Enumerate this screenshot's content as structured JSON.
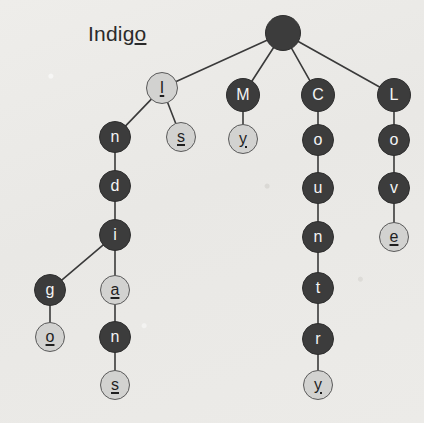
{
  "title": {
    "prefix": "Indig",
    "underlined_suffix": "o",
    "full_text": "Indigo",
    "x": 88,
    "y": 22
  },
  "canvas": {
    "width": 424,
    "height": 423
  },
  "colors": {
    "background": "#ecebe8",
    "node_dark_fill": "#3c3c3c",
    "node_dark_text": "#f4f4f4",
    "node_light_fill": "#d2d2d0",
    "node_light_text": "#1f1f1f",
    "node_light_border": "#5a5a5a",
    "edge": "#3a3a3a"
  },
  "legend": {
    "dark_meaning": "intermediate node",
    "light_meaning": "word-end node (underlined letter)"
  },
  "graph": {
    "type": "trie",
    "words": [
      "I",
      "Is",
      "Indigo",
      "India",
      "Indians",
      "My",
      "Country",
      "Love"
    ],
    "nodes": [
      {
        "id": "root",
        "label": "",
        "style": "dark",
        "terminal": false,
        "x": 283,
        "y": 33,
        "r": 18
      },
      {
        "id": "I",
        "label": "I",
        "style": "light",
        "terminal": true,
        "x": 162,
        "y": 88,
        "r": 16
      },
      {
        "id": "Is",
        "label": "s",
        "style": "light",
        "terminal": true,
        "x": 181,
        "y": 137,
        "r": 15
      },
      {
        "id": "In",
        "label": "n",
        "style": "dark",
        "terminal": false,
        "x": 115,
        "y": 137,
        "r": 16
      },
      {
        "id": "Ind",
        "label": "d",
        "style": "dark",
        "terminal": false,
        "x": 115,
        "y": 186,
        "r": 16
      },
      {
        "id": "Indi",
        "label": "i",
        "style": "dark",
        "terminal": false,
        "x": 115,
        "y": 235,
        "r": 16
      },
      {
        "id": "Indig",
        "label": "g",
        "style": "dark",
        "terminal": false,
        "x": 50,
        "y": 290,
        "r": 16
      },
      {
        "id": "Indigo",
        "label": "o",
        "style": "light",
        "terminal": true,
        "x": 50,
        "y": 337,
        "r": 15
      },
      {
        "id": "India",
        "label": "a",
        "style": "light",
        "terminal": true,
        "x": 115,
        "y": 290,
        "r": 15
      },
      {
        "id": "Indian",
        "label": "n",
        "style": "dark",
        "terminal": false,
        "x": 115,
        "y": 337,
        "r": 16
      },
      {
        "id": "Indians",
        "label": "s",
        "style": "light",
        "terminal": true,
        "x": 115,
        "y": 385,
        "r": 15
      },
      {
        "id": "M",
        "label": "M",
        "style": "dark",
        "terminal": false,
        "x": 243,
        "y": 95,
        "r": 17
      },
      {
        "id": "My",
        "label": "y",
        "style": "light",
        "terminal": true,
        "x": 243,
        "y": 139,
        "r": 15
      },
      {
        "id": "C",
        "label": "C",
        "style": "dark",
        "terminal": false,
        "x": 318,
        "y": 95,
        "r": 17
      },
      {
        "id": "Co",
        "label": "o",
        "style": "dark",
        "terminal": false,
        "x": 318,
        "y": 140,
        "r": 16
      },
      {
        "id": "Cou",
        "label": "u",
        "style": "dark",
        "terminal": false,
        "x": 318,
        "y": 188,
        "r": 16
      },
      {
        "id": "Coun",
        "label": "n",
        "style": "dark",
        "terminal": false,
        "x": 318,
        "y": 237,
        "r": 16
      },
      {
        "id": "Count",
        "label": "t",
        "style": "dark",
        "terminal": false,
        "x": 318,
        "y": 288,
        "r": 16
      },
      {
        "id": "Countr",
        "label": "r",
        "style": "dark",
        "terminal": false,
        "x": 318,
        "y": 339,
        "r": 16
      },
      {
        "id": "Country",
        "label": "y",
        "style": "light",
        "terminal": true,
        "x": 318,
        "y": 385,
        "r": 15
      },
      {
        "id": "L",
        "label": "L",
        "style": "dark",
        "terminal": false,
        "x": 394,
        "y": 95,
        "r": 17
      },
      {
        "id": "Lo",
        "label": "o",
        "style": "dark",
        "terminal": false,
        "x": 394,
        "y": 140,
        "r": 16
      },
      {
        "id": "Lov",
        "label": "v",
        "style": "dark",
        "terminal": false,
        "x": 394,
        "y": 188,
        "r": 16
      },
      {
        "id": "Love",
        "label": "e",
        "style": "light",
        "terminal": true,
        "x": 394,
        "y": 237,
        "r": 15
      }
    ],
    "edges": [
      {
        "from": "root",
        "to": "I"
      },
      {
        "from": "root",
        "to": "M"
      },
      {
        "from": "root",
        "to": "C"
      },
      {
        "from": "root",
        "to": "L"
      },
      {
        "from": "I",
        "to": "In"
      },
      {
        "from": "I",
        "to": "Is"
      },
      {
        "from": "In",
        "to": "Ind"
      },
      {
        "from": "Ind",
        "to": "Indi"
      },
      {
        "from": "Indi",
        "to": "Indig"
      },
      {
        "from": "Indi",
        "to": "India"
      },
      {
        "from": "Indig",
        "to": "Indigo"
      },
      {
        "from": "India",
        "to": "Indian"
      },
      {
        "from": "Indian",
        "to": "Indians"
      },
      {
        "from": "M",
        "to": "My"
      },
      {
        "from": "C",
        "to": "Co"
      },
      {
        "from": "Co",
        "to": "Cou"
      },
      {
        "from": "Cou",
        "to": "Coun"
      },
      {
        "from": "Coun",
        "to": "Count"
      },
      {
        "from": "Count",
        "to": "Countr"
      },
      {
        "from": "Countr",
        "to": "Country"
      },
      {
        "from": "L",
        "to": "Lo"
      },
      {
        "from": "Lo",
        "to": "Lov"
      },
      {
        "from": "Lov",
        "to": "Love"
      }
    ]
  }
}
